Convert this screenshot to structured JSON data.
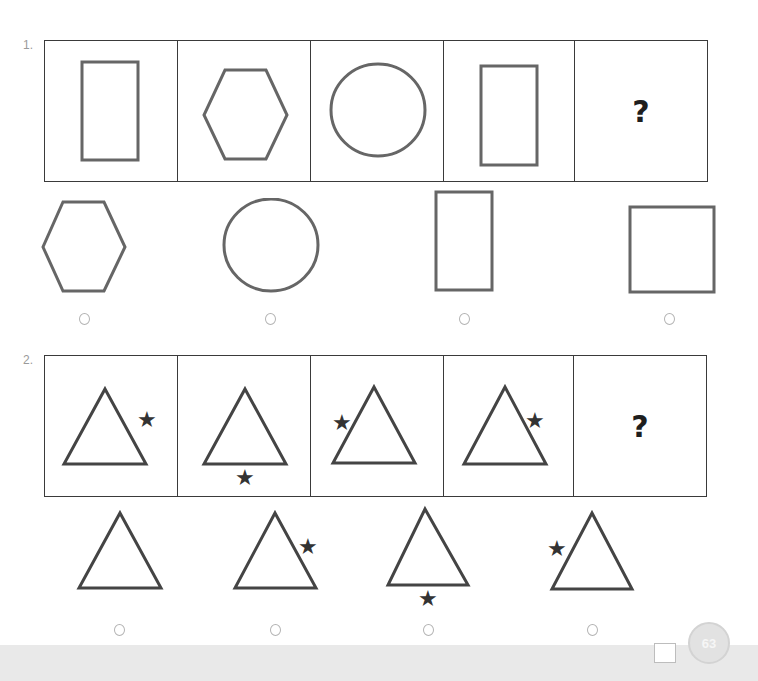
{
  "page": {
    "number": "63",
    "colors": {
      "shape_stroke": "#666666",
      "frame": "#3a3a3a",
      "star": "#333333",
      "radio": "#b3b3b3",
      "footer": "#e9e9e9"
    }
  },
  "questions": [
    {
      "number": "1.",
      "sequence": [
        {
          "shape": "tall-rectangle"
        },
        {
          "shape": "hexagon"
        },
        {
          "shape": "circle"
        },
        {
          "shape": "tall-rectangle"
        },
        {
          "shape": "unknown",
          "label": "?"
        }
      ],
      "options": [
        {
          "shape": "hexagon",
          "selected": false
        },
        {
          "shape": "circle",
          "selected": false
        },
        {
          "shape": "tall-rectangle",
          "selected": false
        },
        {
          "shape": "square",
          "selected": false
        }
      ]
    },
    {
      "number": "2.",
      "sequence": [
        {
          "shape": "triangle",
          "star": "right-side"
        },
        {
          "shape": "triangle",
          "star": "below"
        },
        {
          "shape": "triangle",
          "star": "left-side"
        },
        {
          "shape": "triangle",
          "star": "right-side"
        },
        {
          "shape": "unknown",
          "label": "?"
        }
      ],
      "options": [
        {
          "shape": "triangle",
          "star": "none",
          "selected": false
        },
        {
          "shape": "triangle",
          "star": "right-side",
          "selected": false
        },
        {
          "shape": "triangle",
          "star": "below",
          "selected": false
        },
        {
          "shape": "triangle",
          "star": "left-side",
          "selected": false
        }
      ]
    }
  ]
}
